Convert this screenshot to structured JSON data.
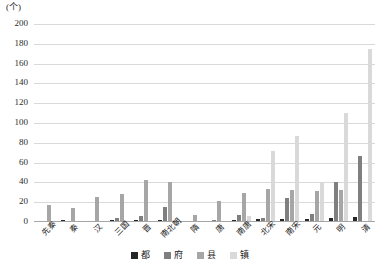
{
  "chart_data": {
    "type": "bar",
    "title": "",
    "subtitle": "",
    "xlabel": "",
    "ylabel": "(个)",
    "unit_caption": "(个)",
    "ylim": [
      0,
      200
    ],
    "ytick_step": 20,
    "yticks": [
      0,
      20,
      40,
      60,
      80,
      100,
      120,
      140,
      160,
      180,
      200
    ],
    "grid": true,
    "grid_axis": "y",
    "legend_position": "bottom",
    "categories": [
      "先秦",
      "秦",
      "汉",
      "三国",
      "晋",
      "南北朝",
      "隋",
      "唐",
      "南唐",
      "北宋",
      "南宋",
      "元",
      "明",
      "清"
    ],
    "series": [
      {
        "name": "都",
        "color": "#262626",
        "values": [
          1,
          2,
          1,
          2,
          2,
          2,
          1,
          1,
          2,
          3,
          3,
          3,
          4,
          5
        ]
      },
      {
        "name": "府",
        "color": "#7f7f7f",
        "values": [
          0,
          0,
          0,
          4,
          6,
          15,
          0,
          2,
          7,
          4,
          24,
          8,
          40,
          67
        ]
      },
      {
        "name": "县",
        "color": "#a6a6a6",
        "values": [
          17,
          14,
          25,
          28,
          42,
          40,
          7,
          21,
          29,
          33,
          32,
          31,
          32,
          0
        ]
      },
      {
        "name": "镇",
        "color": "#d9d9d9",
        "values": [
          0,
          0,
          0,
          0,
          0,
          0,
          0,
          0,
          6,
          72,
          87,
          39,
          110,
          175
        ]
      }
    ]
  },
  "legend": {
    "items": [
      {
        "label": "都",
        "color": "#262626"
      },
      {
        "label": "府",
        "color": "#7f7f7f"
      },
      {
        "label": "县",
        "color": "#a6a6a6"
      },
      {
        "label": "镇",
        "color": "#d9d9d9"
      }
    ]
  }
}
